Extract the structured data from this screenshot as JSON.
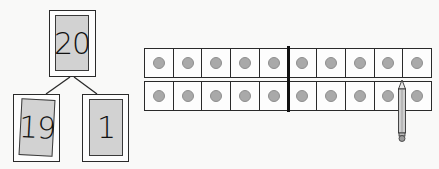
{
  "number_bond": {
    "whole": "20",
    "part_left": "19",
    "part_right": "1"
  },
  "ten_frames": {
    "rows": [
      {
        "cells": [
          true,
          true,
          true,
          true,
          true,
          true,
          true,
          true,
          true,
          true
        ]
      },
      {
        "cells": [
          true,
          true,
          true,
          true,
          true,
          true,
          true,
          true,
          true,
          true
        ]
      }
    ],
    "dot_color": "#a9a9a9",
    "divider_after_column": 5
  },
  "pencil": {
    "icon": "pencil-icon",
    "pointing_at": "between column 9 and column 10"
  }
}
